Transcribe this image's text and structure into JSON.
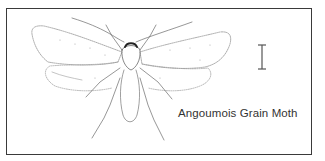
{
  "figure": {
    "caption": "Angoumois Grain Moth",
    "scale_bar": "scale-bar",
    "colors": {
      "line": "#3a3a3a",
      "background": "#ffffff",
      "stipple": "#9a9a9a"
    }
  }
}
